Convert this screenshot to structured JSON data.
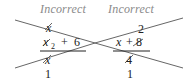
{
  "examples": [
    {
      "label": "Incorrect",
      "numerator": "x",
      "denominator": {
        "var": "x",
        "exp": "2",
        "op": "+",
        "const": "6"
      },
      "cancel_top": "x",
      "result": "1"
    },
    {
      "label": "Incorrect",
      "numerator": "2",
      "denominator": {
        "var": "x",
        "op": "+",
        "const": "8"
      },
      "cancel_top": "4",
      "result": "1"
    }
  ],
  "colors": {
    "label": "#8a8a8a",
    "ink": "#222222",
    "strike": "#555555"
  }
}
